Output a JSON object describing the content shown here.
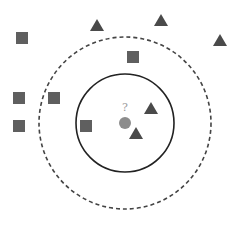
{
  "diagram": {
    "query_label": "?",
    "colors": {
      "square": "#5f5f5f",
      "triangle": "#4a4a4a",
      "query": "#8c8c8c",
      "query_label": "#9a9a9a",
      "inner_circle": "#222222",
      "outer_circle": "#444444",
      "background": "#ffffff"
    },
    "query_point": {
      "cx": 125,
      "cy": 123,
      "r": 6
    },
    "inner_circle": {
      "cx": 125,
      "cy": 123,
      "r": 49,
      "style": "solid"
    },
    "outer_circle": {
      "cx": 125,
      "cy": 123,
      "r": 86,
      "style": "dashed"
    },
    "squares": [
      {
        "x": 22,
        "y": 38
      },
      {
        "x": 133,
        "y": 57
      },
      {
        "x": 19,
        "y": 98
      },
      {
        "x": 54,
        "y": 98
      },
      {
        "x": 19,
        "y": 126
      },
      {
        "x": 86,
        "y": 126
      }
    ],
    "triangles": [
      {
        "x": 97,
        "y": 25
      },
      {
        "x": 161,
        "y": 20
      },
      {
        "x": 220,
        "y": 40
      },
      {
        "x": 151,
        "y": 108
      },
      {
        "x": 136,
        "y": 133
      }
    ]
  }
}
